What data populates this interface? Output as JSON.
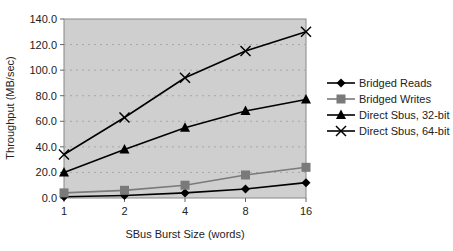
{
  "chart_data": {
    "type": "line",
    "title": "",
    "xlabel": "SBus Burst Size (words)",
    "ylabel": "Throughput (MB/sec)",
    "categories": [
      "1",
      "2",
      "4",
      "8",
      "16"
    ],
    "ylim": [
      0,
      140
    ],
    "yticks": [
      "0.0",
      "20.0",
      "40.0",
      "60.0",
      "80.0",
      "100.0",
      "120.0",
      "140.0"
    ],
    "grid": true,
    "legend_position": "right",
    "plot_background": "#cfcfcf",
    "series": [
      {
        "name": "Bridged Reads",
        "marker": "diamond",
        "color": "#000000",
        "values": [
          1,
          2,
          4,
          7,
          12
        ]
      },
      {
        "name": "Bridged Writes",
        "marker": "square",
        "color": "#7a7a7a",
        "values": [
          4,
          6,
          10,
          18,
          24
        ]
      },
      {
        "name": "Direct Sbus, 32-bit",
        "marker": "triangle",
        "color": "#000000",
        "values": [
          20,
          38,
          55,
          68,
          77
        ]
      },
      {
        "name": "Direct Sbus, 64-bit",
        "marker": "x",
        "color": "#000000",
        "values": [
          34,
          63,
          94,
          115,
          130
        ]
      }
    ]
  }
}
